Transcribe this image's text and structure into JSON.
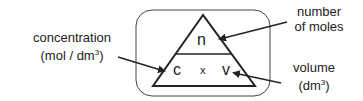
{
  "diagram": {
    "top": "n",
    "bottom_left": "c",
    "operator": "x",
    "bottom_right": "v",
    "labels": {
      "concentration": {
        "line1": "concentration",
        "line2_pre": "(mol / dm",
        "line2_sup": "3",
        "line2_post": ")"
      },
      "number_of_moles": {
        "line1": "number",
        "line2": "of moles"
      },
      "volume": {
        "line1": "volume",
        "line2_pre": "(dm",
        "line2_sup": "3",
        "line2_post": ")"
      }
    },
    "colors": {
      "stroke": "#222222",
      "background": "#ffffff"
    }
  }
}
